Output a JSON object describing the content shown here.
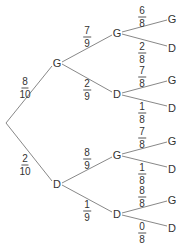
{
  "diagram": {
    "type": "probability-tree",
    "root": {
      "x": 6,
      "y": 123
    },
    "nodes": [
      {
        "id": "L1G",
        "label": "G",
        "x": 57,
        "y": 63
      },
      {
        "id": "L1D",
        "label": "D",
        "x": 57,
        "y": 184
      },
      {
        "id": "L2GG",
        "label": "G",
        "x": 117,
        "y": 33
      },
      {
        "id": "L2GD",
        "label": "D",
        "x": 117,
        "y": 94
      },
      {
        "id": "L2DG",
        "label": "G",
        "x": 117,
        "y": 155
      },
      {
        "id": "L2DD",
        "label": "D",
        "x": 117,
        "y": 214
      },
      {
        "id": "L3GGG",
        "label": "G",
        "x": 172,
        "y": 19
      },
      {
        "id": "L3GGD",
        "label": "D",
        "x": 172,
        "y": 48
      },
      {
        "id": "L3GDG",
        "label": "G",
        "x": 172,
        "y": 80
      },
      {
        "id": "L3GDD",
        "label": "D",
        "x": 172,
        "y": 108
      },
      {
        "id": "L3DGG",
        "label": "G",
        "x": 172,
        "y": 141
      },
      {
        "id": "L3DGD",
        "label": "D",
        "x": 172,
        "y": 169
      },
      {
        "id": "L3DDG",
        "label": "G",
        "x": 172,
        "y": 200
      },
      {
        "id": "L3DDD",
        "label": "D",
        "x": 172,
        "y": 228
      }
    ],
    "probabilities": [
      {
        "num": "8",
        "den": "10",
        "x": 25,
        "y": 88
      },
      {
        "num": "2",
        "den": "10",
        "x": 25,
        "y": 165
      },
      {
        "num": "7",
        "den": "9",
        "x": 87,
        "y": 37
      },
      {
        "num": "2",
        "den": "9",
        "x": 87,
        "y": 90
      },
      {
        "num": "8",
        "den": "9",
        "x": 87,
        "y": 159
      },
      {
        "num": "1",
        "den": "9",
        "x": 87,
        "y": 211
      },
      {
        "num": "6",
        "den": "8",
        "x": 142,
        "y": 17
      },
      {
        "num": "2",
        "den": "8",
        "x": 142,
        "y": 53
      },
      {
        "num": "7",
        "den": "8",
        "x": 142,
        "y": 77
      },
      {
        "num": "1",
        "den": "8",
        "x": 142,
        "y": 113
      },
      {
        "num": "7",
        "den": "8",
        "x": 142,
        "y": 138
      },
      {
        "num": "1",
        "den": "8",
        "x": 142,
        "y": 174
      },
      {
        "num": "8",
        "den": "8",
        "x": 142,
        "y": 197
      },
      {
        "num": "0",
        "den": "8",
        "x": 142,
        "y": 233
      }
    ]
  }
}
